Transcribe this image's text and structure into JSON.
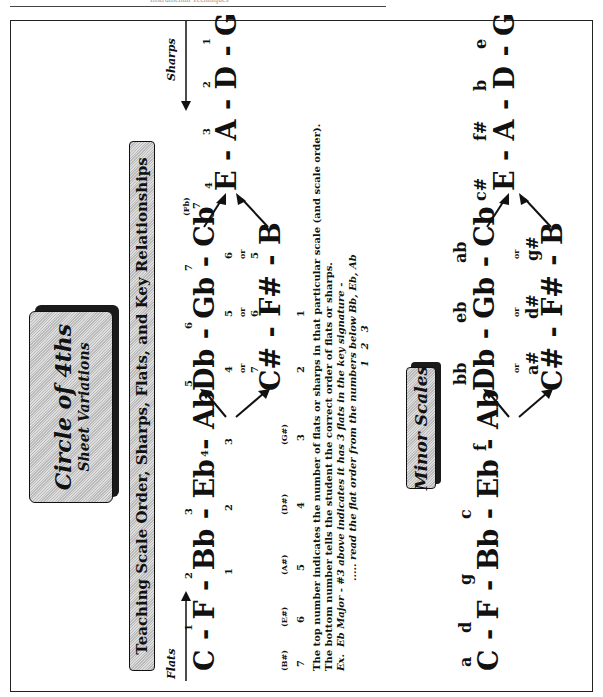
{
  "page_header": {
    "text": "Instrumental Techniques"
  },
  "title_box": {
    "title": "Circle of 4ths",
    "subtitle": "Sheet Variations"
  },
  "banner": {
    "text": "Teaching Scale Order, Sharps, Flats, and Key Relationships"
  },
  "direction_labels": {
    "flats": "Flats",
    "sharps": "Sharps"
  },
  "major_circle": {
    "top_row": [
      {
        "key": "C",
        "top": "",
        "bottom": ""
      },
      {
        "key": "F",
        "top": "1",
        "bottom": ""
      },
      {
        "key": "Bb",
        "top": "2",
        "bottom": "1"
      },
      {
        "key": "Eb",
        "top": "3",
        "bottom": "2"
      },
      {
        "key": "Ab",
        "top": "4",
        "bottom": "3"
      },
      {
        "key": "Db",
        "top": "5",
        "bottom": "4"
      },
      {
        "key": "Gb",
        "top": "6",
        "bottom": "5"
      },
      {
        "key": "Cb",
        "top": "7",
        "bottom": "6",
        "alt": "(Fb)",
        "alt_num": "7"
      },
      {
        "key": "E",
        "top": "4",
        "bottom": ""
      },
      {
        "key": "A",
        "top": "3",
        "bottom": ""
      },
      {
        "key": "D",
        "top": "2",
        "bottom": ""
      },
      {
        "key": "G",
        "top": "1",
        "bottom": ""
      }
    ],
    "enharmonic_row": [
      {
        "key": "C#",
        "top": "7",
        "bottom": "2"
      },
      {
        "key": "F#",
        "top": "6",
        "bottom": "1"
      },
      {
        "key": "B",
        "top": "5",
        "bottom": ""
      }
    ],
    "or_label": "or",
    "sharp_names": [
      "(B#)",
      "(E#)",
      "(A#)",
      "(D#)",
      "(G#)"
    ],
    "sharp_counts": [
      "7",
      "6",
      "5",
      "4",
      "3",
      "2",
      "1"
    ]
  },
  "notes": {
    "line1": "The top number indicates the number of flats or sharps in that particular scale (and scale order).",
    "line2": "The bottom number tells the student the correct order of flats or sharps.",
    "line3_prefix": "Ex.",
    "line3": "Eb Major - #3 above indicates it has 3 flats in the key signature -",
    "line4": "..... read the flat order from the numbers below Bb, Eb, Ab",
    "line5": [
      "1",
      "2",
      "3"
    ]
  },
  "minor_box": {
    "title": "Minor Scales"
  },
  "minor_circle": {
    "top_row": [
      {
        "key": "C",
        "minor": "a"
      },
      {
        "key": "F",
        "minor": "d"
      },
      {
        "key": "Bb",
        "minor": "g"
      },
      {
        "key": "Eb",
        "minor": "c"
      },
      {
        "key": "Ab",
        "minor": "f"
      },
      {
        "key": "Db",
        "minor": "bb"
      },
      {
        "key": "Gb",
        "minor": "eb"
      },
      {
        "key": "Cb",
        "minor": "ab"
      },
      {
        "key": "E",
        "minor": "c#"
      },
      {
        "key": "A",
        "minor": "f#"
      },
      {
        "key": "D",
        "minor": "b"
      },
      {
        "key": "G",
        "minor": "e"
      }
    ],
    "enharmonic_row": [
      {
        "key": "C#",
        "minor": "a#"
      },
      {
        "key": "F#",
        "minor": "d#"
      },
      {
        "key": "B",
        "minor": "g#"
      }
    ],
    "or_label": "or"
  }
}
